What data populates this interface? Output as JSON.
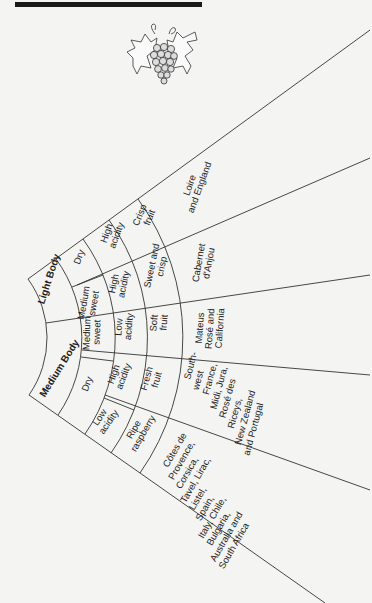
{
  "header": {
    "rule": "top-rule"
  },
  "illustration": {
    "name": "grape-bunch"
  },
  "diagram": {
    "rings": [
      {
        "level": "body",
        "segments": [
          {
            "label": "Light Body"
          },
          {
            "label": "Medium Body"
          }
        ]
      },
      {
        "level": "sweetness",
        "segments": [
          {
            "label": "Dry"
          },
          {
            "label": "Medium sweet"
          },
          {
            "label": "Medium sweet"
          },
          {
            "label": "Dry"
          }
        ]
      },
      {
        "level": "acidity",
        "segments": [
          {
            "label": "High acidity"
          },
          {
            "label": "High acidity"
          },
          {
            "label": "Low acidity"
          },
          {
            "label": "High acidity"
          },
          {
            "label": "Low acidity"
          }
        ]
      },
      {
        "level": "fruit",
        "segments": [
          {
            "label": "Crisp fruit"
          },
          {
            "label": "Sweet and crisp"
          },
          {
            "label": "Soft fruit"
          },
          {
            "label": "Fresh fruit"
          },
          {
            "label": "Ripe raspberry"
          }
        ]
      },
      {
        "level": "examples",
        "segments": [
          {
            "label": "Loire and England"
          },
          {
            "label": "Cabernet d'Anjou"
          },
          {
            "label": "Mateus Rosé and California"
          },
          {
            "label": "South-west France, Midi, Jura, Rosé des Riceys, New Zealand and Portugal"
          },
          {
            "label": "Côtes de Provence, Corsica, Tavel, Lirac, Listel, Spain, Italy, Chile, Bulgaria, Australia and South Africa"
          }
        ]
      }
    ],
    "labels": {
      "light_body": "Light Body",
      "medium_body": "Medium Body",
      "dry_1": "Dry",
      "med_sweet_1a": "Medium",
      "med_sweet_1b": "sweet",
      "med_sweet_2a": "Medium",
      "med_sweet_2b": "sweet",
      "dry_2": "Dry",
      "hi_ac_1a": "High",
      "hi_ac_1b": "acidity",
      "hi_ac_2a": "High",
      "hi_ac_2b": "acidity",
      "lo_ac_1a": "Low",
      "lo_ac_1b": "acidity",
      "hi_ac_3a": "High",
      "hi_ac_3b": "acidity",
      "lo_ac_2a": "Low",
      "lo_ac_2b": "acidity",
      "crisp_a": "Crisp",
      "crisp_b": "fruit",
      "sweetcrisp_a": "Sweet and",
      "sweetcrisp_b": "crisp",
      "soft_a": "Soft",
      "soft_b": "fruit",
      "fresh_a": "Fresh",
      "fresh_b": "fruit",
      "ripe_a": "Ripe",
      "ripe_b": "raspberry",
      "loire": [
        "Loire",
        "and England"
      ],
      "cabernet": [
        "Cabernet",
        "d'Anjou"
      ],
      "mateus": [
        "Mateus",
        "Rosé and",
        "California"
      ],
      "southwest": [
        "South-",
        "west",
        "France,",
        "Midi, Jura,",
        "Rosé des",
        "Riceys,",
        "New Zealand",
        "and Portugal"
      ],
      "cotes": [
        "Côtes de",
        "Provence,",
        "Corsica,",
        "Tavel, Lirac,",
        "Listel,",
        "Spain,",
        "Italy, Chile,",
        "Bulgaria,",
        "Australia and",
        "South Africa"
      ]
    }
  }
}
